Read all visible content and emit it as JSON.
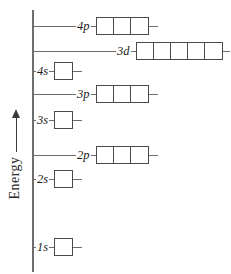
{
  "axis": {
    "label": "Energy",
    "arrow_direction": "up",
    "arrow_icon": "up-arrow-icon"
  },
  "levels": [
    {
      "id": "4p",
      "label": "4p",
      "boxes": 3,
      "leader_px": 44,
      "top_px": 15
    },
    {
      "id": "3d",
      "label": "3d",
      "boxes": 5,
      "leader_px": 84,
      "top_px": 40
    },
    {
      "id": "4s",
      "label": "4s",
      "boxes": 1,
      "leader_px": 4,
      "top_px": 60
    },
    {
      "id": "3p",
      "label": "3p",
      "boxes": 3,
      "leader_px": 44,
      "top_px": 83
    },
    {
      "id": "3s",
      "label": "3s",
      "boxes": 1,
      "leader_px": 4,
      "top_px": 109
    },
    {
      "id": "2p",
      "label": "2p",
      "boxes": 3,
      "leader_px": 44,
      "top_px": 144
    },
    {
      "id": "2s",
      "label": "2s",
      "boxes": 1,
      "leader_px": 4,
      "top_px": 168
    },
    {
      "id": "1s",
      "label": "1s",
      "boxes": 1,
      "leader_px": 4,
      "top_px": 236
    }
  ],
  "colors": {
    "line": "#6d6d6d",
    "box_border": "#4a4a4a",
    "text": "#1a1a1a",
    "background": "#ffffff"
  }
}
